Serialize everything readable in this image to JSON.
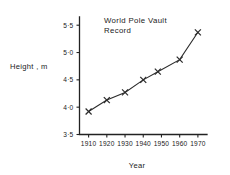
{
  "chart_data": {
    "type": "line",
    "title": "World  Pole  Vault",
    "title_line2": "Record",
    "xlabel": "Year",
    "ylabel": "Height , m",
    "x": [
      1910,
      1920,
      1930,
      1940,
      1948,
      1960,
      1970
    ],
    "values": [
      3.92,
      4.13,
      4.27,
      4.5,
      4.65,
      4.87,
      5.37
    ],
    "series": [
      {
        "name": "World Pole Vault Record",
        "values": [
          3.92,
          4.13,
          4.27,
          4.5,
          4.65,
          4.87,
          5.37
        ]
      }
    ],
    "xlim": [
      1905,
      1975
    ],
    "ylim": [
      3.5,
      5.65
    ],
    "xticks": [
      1910,
      1920,
      1930,
      1940,
      1950,
      1960,
      1970
    ],
    "xtick_labels": [
      "1910",
      "1920",
      "1930",
      "1940",
      "1950",
      "1960",
      "1970"
    ],
    "yticks": [
      3.5,
      4.0,
      4.5,
      5.0,
      5.5
    ],
    "ytick_labels": [
      "3·5",
      "4·0",
      "4·5",
      "5·0",
      "5·5"
    ],
    "grid": false,
    "legend": false,
    "marker": "x",
    "line_color": "#2b2b2b",
    "axis_color": "#222222",
    "background": "#ffffff"
  }
}
